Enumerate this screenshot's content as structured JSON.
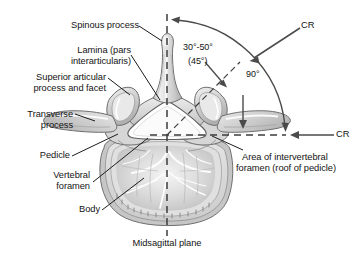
{
  "figure": {
    "background_color": "#ffffff",
    "ink_color": "#141414",
    "bone_fill": "#d9d9d9",
    "bone_light": "#f2f2f2",
    "bone_shadow": "#a8a8a8"
  },
  "labels": {
    "spinous_process": "Spinous process",
    "lamina_line1": "Lamina (pars",
    "lamina_line2": "interarticularis)",
    "superior_articular_line1": "Superior articular",
    "superior_articular_line2": "process and facet",
    "transverse_line1": "Transverse",
    "transverse_line2": "process",
    "pedicle": "Pedicle",
    "vertebral_foramen_line1": "Vertebral",
    "vertebral_foramen_line2": "foramen",
    "body": "Body",
    "midsagittal_plane": "Midsagittal plane",
    "area_ivf_line1": "Area of intervertebral",
    "area_ivf_line2": "foramen (roof of pedicle)"
  },
  "angles": {
    "oblique_range": "30°-50°",
    "oblique_typical": "(45°)",
    "right_angle": "90°"
  },
  "rays": {
    "cr_upper": "CR",
    "cr_lower": "CR"
  }
}
